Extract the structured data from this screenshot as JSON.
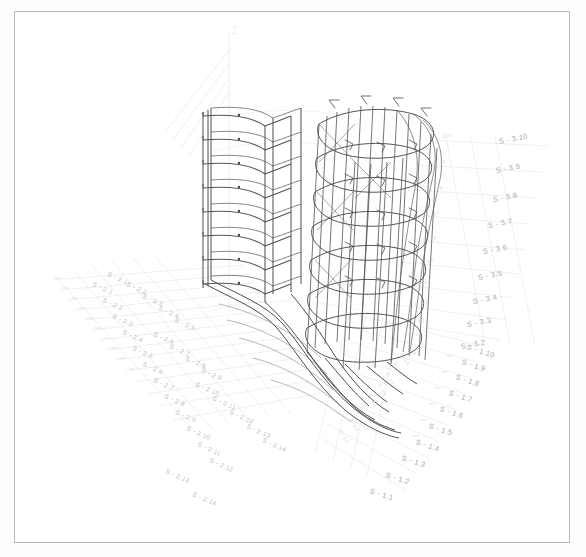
{
  "sheet": {
    "title": "Axonometric structural wireframe drawing",
    "background_color": "#fdfdfd",
    "frame_color": "#b9babc",
    "line_color_dark": "#4a4a4d",
    "line_color_mid": "#8e9094",
    "line_color_faint": "#d6d7da"
  },
  "drawing": {
    "type": "3d-axonometric-wireframe",
    "subject": "multi-storey curved building structural grid",
    "storeys": 9,
    "vertical_axis_label": "S - 0",
    "description": "Stacked floor slabs with curved perimeter beams, vertical columns and radiating grid lines"
  },
  "grids": [
    {
      "name": "grid-s2-left",
      "axis_prefix": "S - 2",
      "direction": "lower-left",
      "labels": [
        "S - 2.1",
        "S - 2.2",
        "S - 2.3",
        "S - 2.4",
        "S - 2.5",
        "S - 2.6",
        "S - 2.7",
        "S - 2.8",
        "S - 2.9",
        "S - 2.10",
        "S - 2.11",
        "S - 2.12",
        "S - 2.13",
        "S - 2.14"
      ],
      "inner_labels": [
        "S - 2.1",
        "S - 2.2",
        "S - 2.3",
        "S - 2.4",
        "S - 2.5",
        "S - 2.6",
        "S - 2.7",
        "S - 2.8",
        "S - 2.9",
        "S - 2.10",
        "S - 2.11",
        "S - 2.12",
        "S - 2.13",
        "S - 2.14"
      ]
    },
    {
      "name": "grid-s3-right",
      "axis_prefix": "S - 3",
      "direction": "upper-right",
      "labels": [
        "S - 3.10",
        "S - 3.9",
        "S - 3.8",
        "S - 3.7",
        "S - 3.6",
        "S - 3.5",
        "S - 3.4",
        "S - 3.3",
        "S - 3.2"
      ],
      "inner_labels": [
        "S - 3.10",
        "S - 3.9",
        "S - 3.8",
        "S - 3.7",
        "S - 3.6",
        "S - 3.5",
        "S - 3.4",
        "S - 3.3",
        "S - 3.2"
      ]
    },
    {
      "name": "grid-s1-right-lower",
      "axis_prefix": "S - 1",
      "direction": "lower-right",
      "labels": [
        "S - 1.10",
        "S - 1.9",
        "S - 1.8",
        "S - 1.7",
        "S - 1.6",
        "S - 1.5",
        "S - 1.4",
        "S - 1.3",
        "S - 1.2",
        "S - 1.1"
      ],
      "inner_labels": [
        "S - 1.10",
        "S - 1.9",
        "S - 1.8",
        "S - 1.7",
        "S - 1.6",
        "S - 1.5",
        "S - 1.4",
        "S - 1.3",
        "S - 1.2",
        "S - 1.1"
      ]
    }
  ],
  "tick_marks": {
    "left_count": 14,
    "right_count": 10,
    "upper_right_count": 9
  }
}
